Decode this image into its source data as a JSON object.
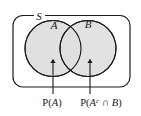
{
  "figure": {
    "type": "venn-diagram",
    "sample_space_label": "S",
    "circles": [
      {
        "name": "circle-a",
        "label": "A",
        "cx": 53,
        "cy": 48.5,
        "r": 28
      },
      {
        "name": "circle-b",
        "label": "B",
        "cx": 88,
        "cy": 48.5,
        "r": 28
      }
    ],
    "annotations": [
      {
        "name": "annotation-p-a",
        "text": "P(A)",
        "parts": [
          {
            "kind": "fn",
            "text": "P("
          },
          {
            "kind": "var",
            "text": "A"
          },
          {
            "kind": "fn",
            "text": ")"
          }
        ],
        "arrow_x": 53,
        "arrow_tip_y": 62,
        "arrow_tail_y": 94,
        "label_x": 52,
        "label_y": 106
      },
      {
        "name": "annotation-p-ac-int-b",
        "text": "P(Ac ∩ B)",
        "parts": [
          {
            "kind": "fn",
            "text": "P("
          },
          {
            "kind": "var",
            "text": "A"
          },
          {
            "kind": "sup",
            "text": "c"
          },
          {
            "kind": "fn",
            "text": " ∩ "
          },
          {
            "kind": "var",
            "text": "B"
          },
          {
            "kind": "fn",
            "text": ")"
          }
        ],
        "arrow_x": 90,
        "arrow_tip_y": 62,
        "arrow_tail_y": 94,
        "label_x": 101,
        "label_y": 106
      }
    ],
    "colors": {
      "stroke": "#1a1a1a",
      "circle_fill": "#e0e0e0",
      "background": "#ffffff"
    },
    "box": {
      "x": 13,
      "y": 15.5,
      "width": 117,
      "height": 71.5,
      "radius": 10
    }
  }
}
